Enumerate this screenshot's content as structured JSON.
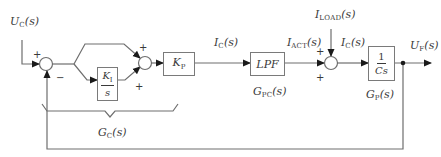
{
  "diagram": {
    "type": "control-loop block diagram",
    "signals": {
      "input": {
        "base": "U",
        "sub": "C",
        "arg": "(s)"
      },
      "controller_output": {
        "base": "I",
        "sub": "C",
        "arg": "(s)"
      },
      "actual_current": {
        "base": "I",
        "sub": "ACT",
        "arg": "(s)"
      },
      "load_current": {
        "base": "I",
        "sub": "LOAD",
        "arg": "(s)"
      },
      "capacitor_current": {
        "base": "I",
        "sub": "C",
        "arg": "(s)"
      },
      "output": {
        "base": "U",
        "sub": "F",
        "arg": "(s)"
      }
    },
    "blocks": {
      "integral": {
        "num_base": "K",
        "num_sub": "I",
        "den": "s"
      },
      "proportional": {
        "base": "K",
        "sub": "P"
      },
      "filter": {
        "label": "LPF"
      },
      "plant": {
        "num": "1",
        "den": "Cs"
      }
    },
    "transfer_labels": {
      "controller": {
        "base": "G",
        "sub": "C",
        "arg": "(s)"
      },
      "filter": {
        "base": "G",
        "sub": "PC",
        "arg": "(s)"
      },
      "plant": {
        "base": "G",
        "sub": "P",
        "arg": "(s)"
      }
    },
    "summing_junctions": {
      "error_sum": {
        "signs": {
          "input": "+",
          "feedback": "−"
        }
      },
      "pi_sum": {
        "signs": {
          "proportional_path": "+",
          "integral_path": "+"
        }
      },
      "current_sum": {
        "signs": {
          "actual": "+",
          "load": "+"
        }
      }
    },
    "colors": {
      "line": "#6e6e6e",
      "text": "#3a3a3a",
      "block_border": "#7a7a7a",
      "background": "#ffffff"
    }
  }
}
